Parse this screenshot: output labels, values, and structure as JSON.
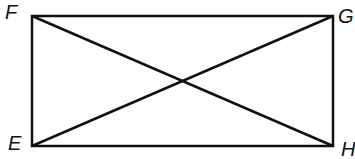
{
  "diagram": {
    "type": "rectangle-with-diagonals",
    "vertices": [
      {
        "label": "F",
        "x": 32,
        "y": 16
      },
      {
        "label": "G",
        "x": 333,
        "y": 16
      },
      {
        "label": "H",
        "x": 333,
        "y": 146
      },
      {
        "label": "E",
        "x": 32,
        "y": 146
      }
    ],
    "diagonals": [
      [
        "F",
        "H"
      ],
      [
        "E",
        "G"
      ]
    ],
    "stroke_color": "#111111",
    "labels": {
      "F": "F",
      "G": "G",
      "E": "E",
      "H": "H"
    }
  }
}
